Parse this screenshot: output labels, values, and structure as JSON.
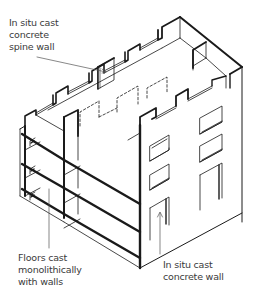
{
  "figure": {
    "colors": {
      "ink": "#1a1a1a",
      "label_text": "#3a3a3a",
      "background": "#ffffff"
    }
  },
  "labels": {
    "spine_wall": {
      "lines": [
        "In situ cast",
        "concrete",
        "spine wall"
      ]
    },
    "floors": {
      "lines": [
        "Floors cast",
        "monolithically",
        "with walls"
      ]
    },
    "concrete_wall": {
      "lines": [
        "In situ cast",
        "concrete wall"
      ]
    }
  }
}
